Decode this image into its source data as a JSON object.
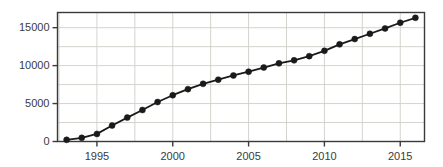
{
  "chart_data": {
    "type": "line",
    "title": "",
    "subtitle": "",
    "xlabel": "",
    "ylabel": "",
    "xlim": [
      1992.4,
      1992.4
    ],
    "ylim": [
      0,
      17000
    ],
    "grid": true,
    "legend": false,
    "legend_position": "none",
    "marker": "filled-circle",
    "line_color": "#1a1a1a",
    "marker_color": "#1a1a1a",
    "grid_color": "#cfcfc8",
    "frame_color": "#3a3a3a",
    "background_color": "#ffffff",
    "x_axis": {
      "tick_values": [
        1995,
        2000,
        2005,
        2010,
        2015
      ],
      "tick_labels": [
        "1995",
        "2000",
        "2005",
        "2010",
        "2015"
      ],
      "min": 1992.4,
      "max": 2016.6,
      "gridline_values": [
        1992.5,
        1995,
        1997.5,
        2000,
        2002.5,
        2005,
        2007.5,
        2010,
        2012.5,
        2015
      ]
    },
    "y_axis": {
      "tick_values": [
        0,
        5000,
        10000,
        15000
      ],
      "tick_labels": [
        "0",
        "5000",
        "10000",
        "15000"
      ],
      "min": 0,
      "max": 17000,
      "gridline_values": [
        0,
        2500,
        5000,
        7500,
        10000,
        12500,
        15000
      ]
    },
    "x": [
      1993,
      1994,
      1995,
      1996,
      1997,
      1998,
      1999,
      2000,
      2001,
      2002,
      2003,
      2004,
      2005,
      2006,
      2007,
      2008,
      2009,
      2010,
      2011,
      2012,
      2013,
      2014,
      2015,
      2016
    ],
    "values": [
      220,
      480,
      1000,
      2100,
      3150,
      4150,
      5200,
      6100,
      6900,
      7600,
      8150,
      8700,
      9200,
      9750,
      10300,
      10700,
      11250,
      11950,
      12800,
      13500,
      14200,
      14900,
      15650,
      16300
    ],
    "series": [
      {
        "name": "series-1",
        "x": [
          1993,
          1994,
          1995,
          1996,
          1997,
          1998,
          1999,
          2000,
          2001,
          2002,
          2003,
          2004,
          2005,
          2006,
          2007,
          2008,
          2009,
          2010,
          2011,
          2012,
          2013,
          2014,
          2015,
          2016
        ],
        "values": [
          220,
          480,
          1000,
          2100,
          3150,
          4150,
          5200,
          6100,
          6900,
          7600,
          8150,
          8700,
          9200,
          9750,
          10300,
          10700,
          11250,
          11950,
          12800,
          13500,
          14200,
          14900,
          15650,
          16300
        ]
      }
    ]
  }
}
